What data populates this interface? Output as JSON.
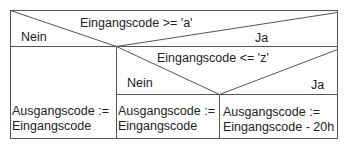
{
  "diagram": {
    "type": "nassi-shneiderman",
    "outer_decision": {
      "condition": "Eingangscode >= 'a'",
      "false_label": "Nein",
      "true_label": "Ja",
      "false_branch": {
        "line1": "Ausgangscode :=",
        "line2": "Eingangscode"
      }
    },
    "inner_decision": {
      "condition": "Eingangscode <= 'z'",
      "false_label": "Nein",
      "true_label": "Ja",
      "false_branch": {
        "line1": "Ausgangscode :=",
        "line2": "Eingangscode"
      },
      "true_branch": {
        "line1": "Ausgangscode :=",
        "line2": "Eingangscode - 20h"
      }
    }
  }
}
